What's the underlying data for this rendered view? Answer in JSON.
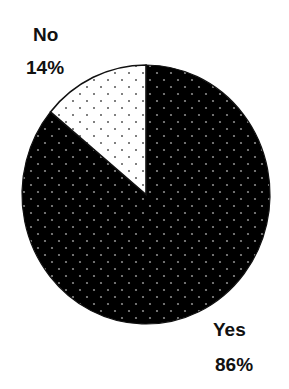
{
  "chart_data": {
    "type": "pie",
    "title": "",
    "categories": [
      "Yes",
      "No"
    ],
    "values": [
      86,
      14
    ],
    "unit": "%",
    "slices": [
      {
        "label": "Yes",
        "value": 86,
        "display": "86%",
        "fill": "#000000",
        "pattern_dot_color": "#8a8a8a"
      },
      {
        "label": "No",
        "value": 14,
        "display": "14%",
        "fill": "#ffffff",
        "pattern_dot_color": "#555555"
      }
    ],
    "start_angle": "12 o'clock",
    "direction": "No slice counterclockwise from top; Yes slice fills remainder",
    "legend": "none (direct labels)",
    "grid": false
  },
  "labels": {
    "no_name": "No",
    "no_pct": "14%",
    "yes_name": "Yes",
    "yes_pct": "86%"
  },
  "geometry": {
    "cx": 146,
    "cy": 194.5,
    "rx": 124,
    "ry": 129.5
  }
}
